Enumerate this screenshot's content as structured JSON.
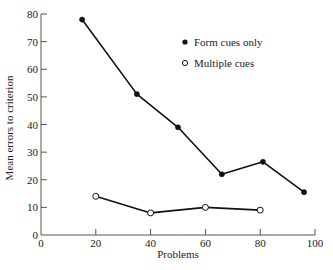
{
  "chart_data": {
    "type": "line",
    "title": "",
    "xlabel": "Problems",
    "ylabel": "Mean errors to criterion",
    "xlim": [
      0,
      100
    ],
    "ylim": [
      0,
      80
    ],
    "xticks": [
      0,
      20,
      40,
      60,
      80,
      100
    ],
    "yticks": [
      0,
      10,
      20,
      30,
      40,
      50,
      60,
      70,
      80
    ],
    "grid": false,
    "legend_position": "top-right",
    "series": [
      {
        "name": "Form cues only",
        "marker": "filled-circle",
        "color": "#111111",
        "x": [
          15,
          35,
          50,
          66,
          81,
          96
        ],
        "y": [
          78,
          51,
          39,
          22,
          26.5,
          15.5
        ]
      },
      {
        "name": "Multiple cues",
        "marker": "open-circle",
        "color": "#111111",
        "x": [
          20,
          40,
          60,
          80
        ],
        "y": [
          14,
          8,
          10,
          9
        ]
      }
    ]
  }
}
